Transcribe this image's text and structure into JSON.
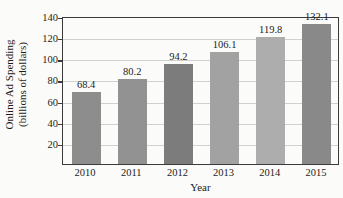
{
  "chart_data": {
    "type": "bar",
    "title": "",
    "xlabel": "Year",
    "ylabel": "Online Ad Spending (billions of dollars)",
    "ylabel_line1": "Online Ad Spending",
    "ylabel_line2": "(billions of dollars)",
    "categories": [
      "2010",
      "2011",
      "2012",
      "2013",
      "2014",
      "2015"
    ],
    "values": [
      68.4,
      80.2,
      94.2,
      106.1,
      119.8,
      132.1
    ],
    "value_labels": [
      "68.4",
      "80.2",
      "94.2",
      "106.1",
      "119.8",
      "132.1"
    ],
    "ylim": [
      0,
      140
    ],
    "yticks": [
      20,
      40,
      60,
      80,
      100,
      120,
      140
    ],
    "ytick_labels": [
      "20",
      "40",
      "60",
      "80",
      "100",
      "120",
      "140"
    ],
    "grid": true,
    "legend": false,
    "bar_colors": [
      "#8d8d8d",
      "#929292",
      "#7c7c7c",
      "#a2a2a2",
      "#adadad",
      "#898989"
    ],
    "axis_color": "#3a3a3a",
    "grid_color": "#d2d2cc",
    "text_color": "#1b1b1b",
    "background": "#fbfbf9"
  }
}
